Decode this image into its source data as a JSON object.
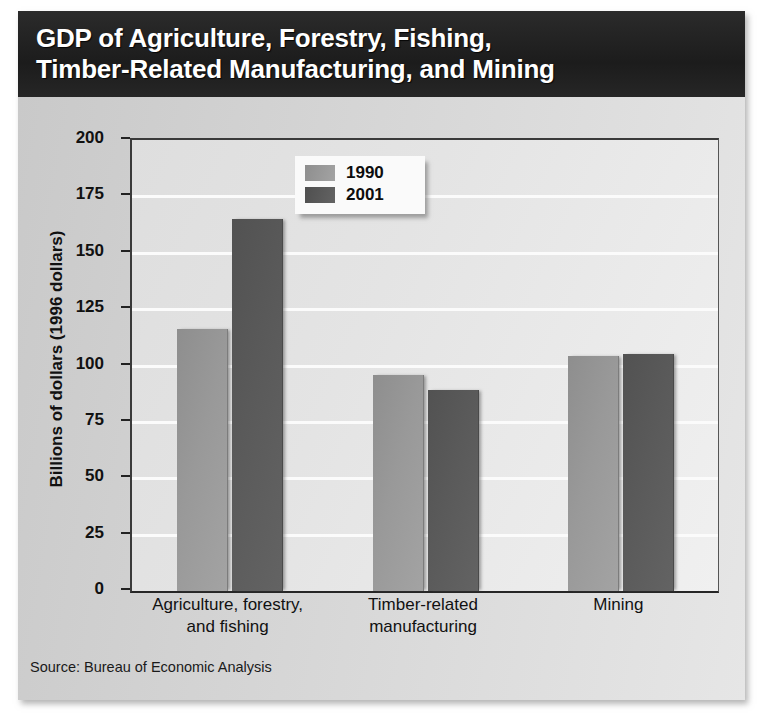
{
  "chart_data": {
    "type": "bar",
    "title": "GDP of Agriculture, Forestry, Fishing,\nTimber-Related Manufacturing, and Mining",
    "xlabel": "",
    "ylabel": "Billions of dollars (1996 dollars)",
    "ylim": [
      0,
      200
    ],
    "yticks": [
      0,
      25,
      50,
      75,
      100,
      125,
      150,
      175,
      200
    ],
    "ytick_labels": [
      "0",
      "25",
      "50",
      "75",
      "100",
      "125",
      "150",
      "175",
      "200"
    ],
    "grid": true,
    "legend_position": "upper-center",
    "categories": [
      "Agriculture, forestry,\nand fishing",
      "Timber-related\nmanufacturing",
      "Mining"
    ],
    "series": [
      {
        "name": "1990",
        "color": "#999999",
        "values": [
          116,
          96,
          104
        ]
      },
      {
        "name": "2001",
        "color": "#5a5a5a",
        "values": [
          165,
          89,
          105
        ]
      }
    ],
    "source": "Source: Bureau of Economic Analysis"
  },
  "legend": {
    "items": [
      {
        "label": "1990"
      },
      {
        "label": "2001"
      }
    ]
  }
}
